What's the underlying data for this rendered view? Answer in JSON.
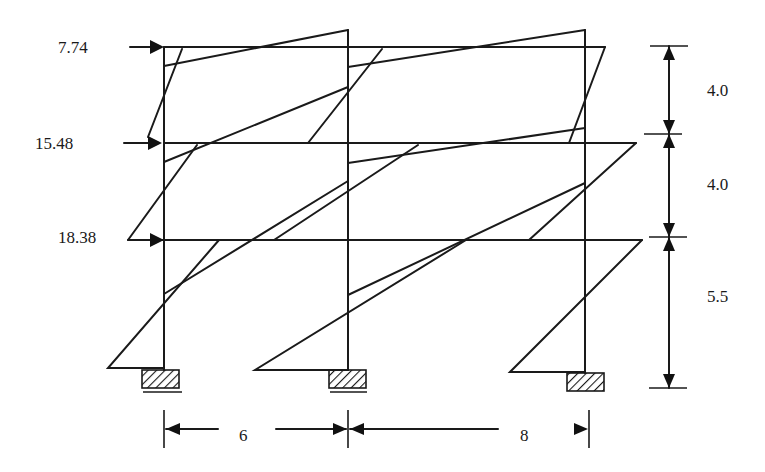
{
  "diagram": {
    "type": "frame-moment-diagram",
    "lateral_loads": [
      {
        "level": "roof",
        "value": "7.74"
      },
      {
        "level": "second",
        "value": "15.48"
      },
      {
        "level": "first",
        "value": "18.38"
      }
    ],
    "storey_heights": [
      {
        "label": "4.0"
      },
      {
        "label": "4.0"
      },
      {
        "label": "5.5"
      }
    ],
    "bay_widths": [
      {
        "label": "6"
      },
      {
        "label": "8"
      }
    ],
    "supports": [
      "fixed-support",
      "fixed-support",
      "fixed-support"
    ],
    "colors": {
      "line": "#1a1a1a",
      "background": "#ffffff"
    }
  }
}
